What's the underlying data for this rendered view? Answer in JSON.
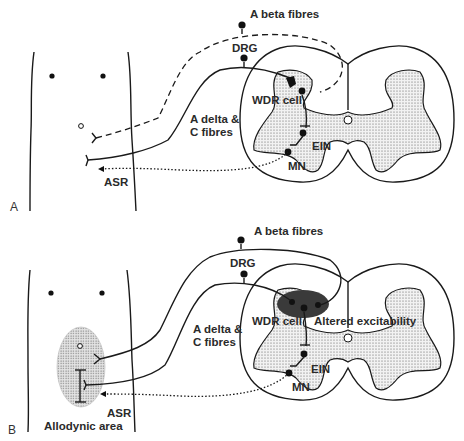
{
  "panels": [
    {
      "id": "A",
      "panel_label": "A",
      "labels": {
        "a_beta": "A beta fibres",
        "drg": "DRG",
        "a_delta_1": "A delta &",
        "a_delta_2": "C fibres",
        "wdr": "WDR cell",
        "ein": "EIN",
        "mn": "MN",
        "asr": "ASR"
      }
    },
    {
      "id": "B",
      "panel_label": "B",
      "labels": {
        "a_beta": "A beta fibres",
        "drg": "DRG",
        "a_delta_1": "A delta &",
        "a_delta_2": "C fibres",
        "wdr": "WDR cell",
        "altered": "Altered excitability",
        "ein": "EIN",
        "mn": "MN",
        "asr": "ASR",
        "allodynic": "Allodynic area"
      }
    }
  ],
  "colors": {
    "line": "#1a1a1a",
    "grey_matter": "#e6e6e6",
    "altered_zone": "#3a3a3a",
    "allodynic_zone": "#d8d8d8"
  }
}
